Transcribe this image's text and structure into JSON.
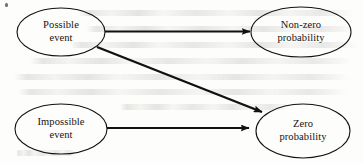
{
  "figure": {
    "type": "flow-diagram",
    "background_color": "#fdfdfb",
    "stroke_color": "#111111",
    "text_color": "#15120f",
    "nodes": [
      {
        "id": "possible-event",
        "line1": "Possible",
        "line2": "event",
        "shape": "ellipse",
        "cx": 61,
        "cy": 32,
        "rx": 44,
        "ry": 24
      },
      {
        "id": "non-zero-probability",
        "line1": "Non-zero",
        "line2": "probability",
        "shape": "ellipse",
        "cx": 301,
        "cy": 32,
        "rx": 50,
        "ry": 25
      },
      {
        "id": "impossible-event",
        "line1": "Impossible",
        "line2": "event",
        "shape": "ellipse",
        "cx": 61,
        "cy": 129,
        "rx": 46,
        "ry": 25
      },
      {
        "id": "zero-probability",
        "line1": "Zero",
        "line2": "probability",
        "shape": "ellipse",
        "cx": 303,
        "cy": 131,
        "rx": 47,
        "ry": 27
      }
    ],
    "edges": [
      {
        "id": "possible-to-nonzero",
        "from": "possible-event",
        "to": "non-zero-probability",
        "style": "solid-arrow",
        "label": ""
      },
      {
        "id": "possible-to-zero",
        "from": "possible-event",
        "to": "zero-probability",
        "style": "solid-arrow",
        "label": ""
      },
      {
        "id": "impossible-to-zero",
        "from": "impossible-event",
        "to": "zero-probability",
        "style": "solid-arrow",
        "label": ""
      }
    ]
  }
}
